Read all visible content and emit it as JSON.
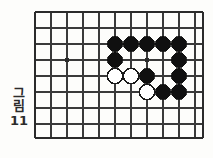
{
  "figure": {
    "caption_label": "그림",
    "caption_number": "11",
    "caption_full": "그림 11"
  },
  "board": {
    "type": "go-board-diagram",
    "description": "Go (baduk) board fragment showing a corner/side position",
    "line_color": "#3a3a3a",
    "edge_color": "#2b2b2b",
    "black_stone_color": "#101010",
    "white_stone_color": "#ffffff",
    "white_stone_border": "#1a1a1a",
    "background_color": "#fdfdfb",
    "grid": {
      "x_lines": [
        35,
        51,
        67,
        83,
        99,
        115,
        131,
        147,
        163,
        179,
        195
      ],
      "y_lines": [
        12,
        28,
        44,
        60,
        76,
        92,
        108,
        124
      ],
      "edge_top": 12,
      "edge_left": 35,
      "edge_right": 203,
      "edge_bottom": 138,
      "spacing": 16
    },
    "star_points": [
      {
        "x": 67,
        "y": 60
      },
      {
        "x": 147,
        "y": 60
      }
    ],
    "stone_radius": 7.6,
    "stones": [
      {
        "color": "black",
        "x": 115,
        "y": 44
      },
      {
        "color": "black",
        "x": 131,
        "y": 44
      },
      {
        "color": "black",
        "x": 147,
        "y": 44
      },
      {
        "color": "black",
        "x": 163,
        "y": 44
      },
      {
        "color": "black",
        "x": 179,
        "y": 44
      },
      {
        "color": "black",
        "x": 115,
        "y": 60
      },
      {
        "color": "black",
        "x": 179,
        "y": 60
      },
      {
        "color": "white",
        "x": 115,
        "y": 76
      },
      {
        "color": "white",
        "x": 131,
        "y": 76
      },
      {
        "color": "black",
        "x": 147,
        "y": 76
      },
      {
        "color": "black",
        "x": 179,
        "y": 76
      },
      {
        "color": "white",
        "x": 147,
        "y": 92
      },
      {
        "color": "black",
        "x": 163,
        "y": 92
      },
      {
        "color": "black",
        "x": 179,
        "y": 92
      }
    ],
    "counts": {
      "black_stones": "10",
      "white_stones": "4"
    }
  }
}
